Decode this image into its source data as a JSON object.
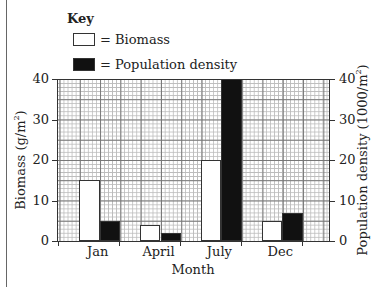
{
  "key": {
    "title": "Key",
    "items": [
      {
        "label": "= Biomass",
        "swatch": "#ffffff"
      },
      {
        "label": "= Population density",
        "swatch": "#111111"
      }
    ]
  },
  "axes": {
    "x_title": "Month",
    "y_left_title": "Biomass (g/m",
    "y_left_sup": "2",
    "y_left_close": ")",
    "y_right_title": "Population density (1000/m",
    "y_right_sup": "2",
    "y_right_close": ")",
    "y_ticks": [
      "0",
      "10",
      "20",
      "30",
      "40"
    ],
    "x_ticks": [
      "Jan",
      "April",
      "July",
      "Dec"
    ]
  },
  "chart_data": {
    "type": "bar",
    "title": "",
    "categories": [
      "Jan",
      "April",
      "July",
      "Dec"
    ],
    "series": [
      {
        "name": "Biomass",
        "axis": "left",
        "unit": "g/m2",
        "color": "#ffffff",
        "values": [
          15,
          4,
          20,
          5
        ]
      },
      {
        "name": "Population density",
        "axis": "right",
        "unit": "1000/m2",
        "color": "#111111",
        "values": [
          5,
          2,
          40,
          7
        ]
      }
    ],
    "xlabel": "Month",
    "ylabel": "Biomass (g/m2)",
    "ylabel_right": "Population density (1000/m2)",
    "ylim": [
      0,
      40
    ],
    "ylim_right": [
      0,
      40
    ],
    "grid": true,
    "legend_position": "top-left (Key)"
  }
}
